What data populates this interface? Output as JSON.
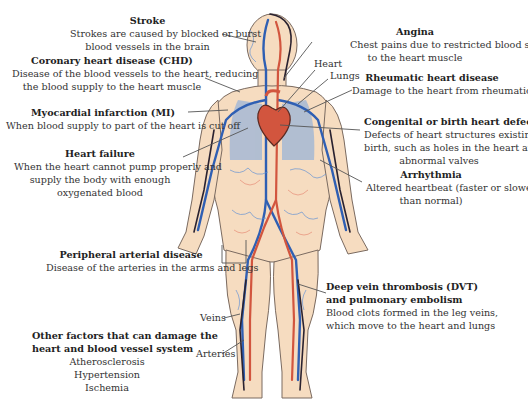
{
  "diagram": {
    "colors": {
      "skin": "#f6dcc0",
      "skin_outline": "#7a6a60",
      "veins": "#2f5fb3",
      "veins_light": "#6a9ad8",
      "arteries": "#d2553e",
      "arteries_light": "#e8907a",
      "dark_vessels": "#2a2230",
      "leader_line": "#555555",
      "text": "#333333"
    },
    "anatomy_labels": {
      "heart": "Heart",
      "lungs": "Lungs",
      "veins": "Veins",
      "arteries": "Arteries"
    },
    "conditions": [
      {
        "id": "stroke",
        "title": "Stroke",
        "description_lines": [
          "Strokes are caused by blocked or burst",
          "blood vessels in the brain"
        ]
      },
      {
        "id": "chd",
        "title": "Coronary heart disease (CHD)",
        "description_lines": [
          "Disease of the blood vessels to the heart, reducing",
          "the blood supply to the heart muscle"
        ]
      },
      {
        "id": "mi",
        "title": "Myocardial infarction (MI)",
        "description_lines": [
          "When blood supply to part of the heart is cut off"
        ]
      },
      {
        "id": "heart_failure",
        "title": "Heart failure",
        "description_lines": [
          "When the heart cannot pump properly and",
          "supply the body with enough",
          "oxygenated blood"
        ]
      },
      {
        "id": "pad",
        "title": "Peripheral arterial disease",
        "description_lines": [
          "Disease of the arteries in the arms and legs"
        ]
      },
      {
        "id": "angina",
        "title": "Angina",
        "description_lines": [
          "Chest pains due to restricted blood supply",
          "to the heart muscle"
        ]
      },
      {
        "id": "rheumatic",
        "title": "Rheumatic heart disease",
        "description_lines": [
          "Damage to the heart from rheumatic fever"
        ]
      },
      {
        "id": "congenital",
        "title": "Congenital or birth heart defects",
        "description_lines": [
          "Defects of heart structures existing at",
          "birth, such as holes in the heart and",
          "abnormal valves"
        ]
      },
      {
        "id": "arrhythmia",
        "title": "Arrhythmia",
        "description_lines": [
          "Altered heartbeat (faster or slower",
          "than normal)"
        ]
      },
      {
        "id": "dvt",
        "title_lines": [
          "Deep vein thrombosis (DVT)",
          "and pulmonary embolism"
        ],
        "description_lines": [
          "Blood clots formed in the leg veins,",
          "which move to the heart and lungs"
        ]
      }
    ],
    "other_factors": {
      "title_lines": [
        "Other factors that can damage the",
        "heart and blood vessel system"
      ],
      "items": [
        "Atherosclerosis",
        "Hypertension",
        "Ischemia"
      ]
    }
  }
}
